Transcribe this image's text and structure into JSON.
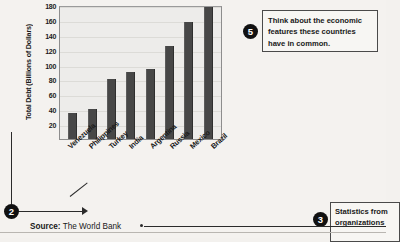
{
  "chart_data": {
    "type": "bar",
    "title": "",
    "xlabel": "",
    "ylabel": "Total Debt (Billions of Dollars)",
    "ylim": [
      0,
      180
    ],
    "yticks": [
      180,
      160,
      140,
      120,
      100,
      80,
      60,
      40,
      20
    ],
    "grid": true,
    "legend": "none",
    "categories": [
      "Venezuela",
      "Philippines",
      "Turkey",
      "India",
      "Argentina",
      "Russia",
      "Mexico",
      "Brazil"
    ],
    "values": [
      35,
      40,
      80,
      90,
      94,
      125,
      157,
      178
    ],
    "bar_color": "#474747",
    "plot_background": "#edecea"
  },
  "callouts": {
    "five": {
      "number": "5",
      "text": "Think about the economic features these countries have in common."
    },
    "three": {
      "number": "3",
      "text": "Statistics from organizations"
    },
    "two": {
      "number": "2"
    }
  },
  "source": {
    "label": "Source:",
    "value": "The World Bank"
  }
}
